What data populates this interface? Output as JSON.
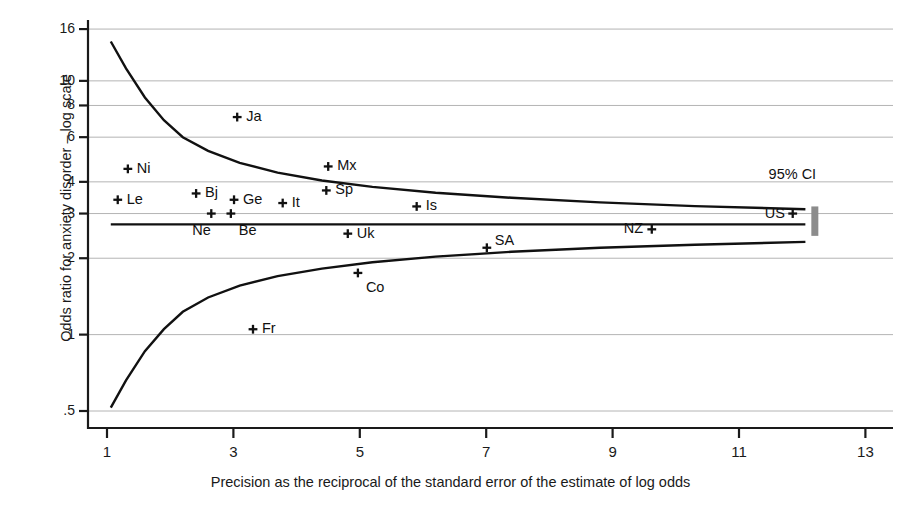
{
  "chart_data": {
    "type": "scatter",
    "title": "",
    "xlabel": "Precision as the reciprocal of the standard error of the estimate of log odds",
    "ylabel": "Odds ratio for anxiety disorder – log scale",
    "xlim": [
      0.6,
      13.4
    ],
    "ylim": [
      0.47,
      17.5
    ],
    "yscale": "log",
    "xticks": [
      1,
      3,
      5,
      7,
      9,
      11,
      13
    ],
    "xtick_labels": [
      "1",
      "3",
      "5",
      "7",
      "9",
      "11",
      "13"
    ],
    "yticks": [
      0.5,
      1,
      2,
      3,
      4,
      6,
      8,
      10,
      16
    ],
    "ytick_labels": [
      ".5",
      "1",
      "2",
      "3",
      "4",
      "6",
      "8",
      "10",
      "16"
    ],
    "grid": "horizontal",
    "legend": "none",
    "points": [
      {
        "label": "Ni",
        "x": 1.33,
        "y": 4.5,
        "label_dx": 9,
        "label_dy": -1
      },
      {
        "label": "Le",
        "x": 1.17,
        "y": 3.4,
        "label_dx": 9,
        "label_dy": -1
      },
      {
        "label": "Ja",
        "x": 3.06,
        "y": 7.2,
        "label_dx": 9,
        "label_dy": -1
      },
      {
        "label": "Bj",
        "x": 2.41,
        "y": 3.6,
        "label_dx": 9,
        "label_dy": -1
      },
      {
        "label": "Ge",
        "x": 3.01,
        "y": 3.4,
        "label_dx": 9,
        "label_dy": -1
      },
      {
        "label": "It",
        "x": 3.78,
        "y": 3.3,
        "label_dx": 9,
        "label_dy": -1
      },
      {
        "label": "Mx",
        "x": 4.5,
        "y": 4.6,
        "label_dx": 9,
        "label_dy": -1
      },
      {
        "label": "Sp",
        "x": 4.47,
        "y": 3.7,
        "label_dx": 9,
        "label_dy": -1
      },
      {
        "label": "Ne",
        "x": 2.65,
        "y": 3.0,
        "label_dx": -19,
        "label_dy": 16
      },
      {
        "label": "Be",
        "x": 2.96,
        "y": 3.0,
        "label_dx": 8,
        "label_dy": 16
      },
      {
        "label": "Is",
        "x": 5.9,
        "y": 3.2,
        "label_dx": 9,
        "label_dy": -1
      },
      {
        "label": "Uk",
        "x": 4.81,
        "y": 2.5,
        "label_dx": 9,
        "label_dy": -1
      },
      {
        "label": "SA",
        "x": 7.01,
        "y": 2.2,
        "label_dx": 8,
        "label_dy": -8
      },
      {
        "label": "NZ",
        "x": 9.62,
        "y": 2.6,
        "label_dx": -28,
        "label_dy": -1
      },
      {
        "label": "US",
        "x": 11.85,
        "y": 3.0,
        "label_dx": -28,
        "label_dy": -1
      },
      {
        "label": "Co",
        "x": 4.97,
        "y": 1.75,
        "label_dx": 8,
        "label_dy": 14
      },
      {
        "label": "Fr",
        "x": 3.31,
        "y": 1.05,
        "label_dx": 9,
        "label_dy": -1
      }
    ],
    "pooled_line": {
      "y": 2.72,
      "x_start": 1.06,
      "x_end": 12.05
    },
    "funnel_upper": [
      {
        "x": 1.06,
        "y": 14.3
      },
      {
        "x": 1.3,
        "y": 11.2
      },
      {
        "x": 1.6,
        "y": 8.6
      },
      {
        "x": 1.9,
        "y": 7.0
      },
      {
        "x": 2.2,
        "y": 6.0
      },
      {
        "x": 2.6,
        "y": 5.3
      },
      {
        "x": 3.1,
        "y": 4.75
      },
      {
        "x": 3.7,
        "y": 4.35
      },
      {
        "x": 4.4,
        "y": 4.05
      },
      {
        "x": 5.2,
        "y": 3.82
      },
      {
        "x": 6.2,
        "y": 3.62
      },
      {
        "x": 7.4,
        "y": 3.46
      },
      {
        "x": 8.8,
        "y": 3.32
      },
      {
        "x": 10.3,
        "y": 3.21
      },
      {
        "x": 12.05,
        "y": 3.12
      }
    ],
    "funnel_lower": [
      {
        "x": 1.06,
        "y": 0.515
      },
      {
        "x": 1.3,
        "y": 0.66
      },
      {
        "x": 1.6,
        "y": 0.86
      },
      {
        "x": 1.9,
        "y": 1.05
      },
      {
        "x": 2.2,
        "y": 1.23
      },
      {
        "x": 2.6,
        "y": 1.4
      },
      {
        "x": 3.1,
        "y": 1.56
      },
      {
        "x": 3.7,
        "y": 1.7
      },
      {
        "x": 4.4,
        "y": 1.82
      },
      {
        "x": 5.2,
        "y": 1.93
      },
      {
        "x": 6.2,
        "y": 2.03
      },
      {
        "x": 7.4,
        "y": 2.12
      },
      {
        "x": 8.8,
        "y": 2.2
      },
      {
        "x": 10.3,
        "y": 2.26
      },
      {
        "x": 12.05,
        "y": 2.32
      }
    ],
    "ci_annotation": {
      "text": "95%  CI",
      "x": 11.5,
      "y": 4.3
    },
    "ci_bar": {
      "x": 12.2,
      "y_low": 2.45,
      "y_high": 3.2,
      "color": "#8c8c8c"
    }
  },
  "style": {
    "axis_color": "#1a1a1a",
    "grid_color": "#b4b4b4",
    "curve_color": "#111111",
    "marker_color": "#111111",
    "background": "#ffffff"
  }
}
